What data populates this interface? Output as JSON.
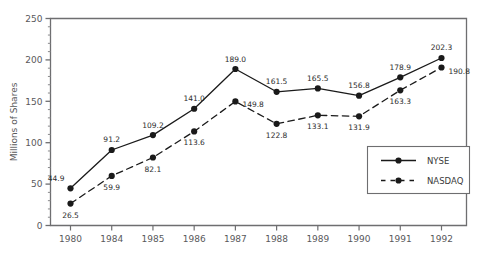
{
  "chart_data": {
    "type": "line",
    "title": "",
    "xlabel": "",
    "ylabel": "Millions of Shares",
    "categories": [
      "1980",
      "1984",
      "1985",
      "1986",
      "1987",
      "1988",
      "1989",
      "1990",
      "1991",
      "1992"
    ],
    "ylim": [
      0,
      250
    ],
    "yticks": [
      0,
      50,
      100,
      150,
      200,
      250
    ],
    "ytick_labels": [
      "0",
      "50",
      "100",
      "150",
      "200",
      "250"
    ],
    "y_minor_tick_step": 10,
    "grid": false,
    "legend_position": "lower-right-inside",
    "series": [
      {
        "name": "NYSE",
        "style": "solid",
        "marker": "filled-circle",
        "color": "#1a1a1a",
        "values": [
          44.9,
          91.2,
          109.2,
          141.0,
          189.0,
          161.5,
          165.5,
          156.8,
          178.9,
          202.3
        ],
        "labels": [
          "44.9",
          "91.2",
          "109.2",
          "141.0",
          "189.0",
          "161.5",
          "165.5",
          "156.8",
          "178.9",
          "202.3"
        ],
        "label_positions": [
          "above-left",
          "above",
          "above",
          "above",
          "above",
          "above",
          "above",
          "above",
          "above",
          "above"
        ]
      },
      {
        "name": "NASDAQ",
        "style": "dashed",
        "marker": "filled-circle",
        "color": "#1a1a1a",
        "values": [
          26.5,
          59.9,
          82.1,
          113.6,
          149.8,
          122.8,
          133.1,
          131.9,
          163.3,
          190.8
        ],
        "labels": [
          "26.5",
          "59.9",
          "82.1",
          "113.6",
          "149.8",
          "122.8",
          "133.1",
          "131.9",
          "163.3",
          "190.8"
        ],
        "label_positions": [
          "below",
          "below",
          "below",
          "below",
          "below-right",
          "below",
          "below",
          "below",
          "below",
          "below-right"
        ]
      }
    ]
  },
  "legend": {
    "items": [
      {
        "label": "NYSE",
        "style": "solid"
      },
      {
        "label": "NASDAQ",
        "style": "dashed"
      }
    ]
  },
  "colors": {
    "axis": "#6e6e70",
    "frame": "#6e6e70",
    "series": "#1a1a1a",
    "text": "#59595b",
    "label_text": "#2b2b2b",
    "background": "#ffffff"
  }
}
